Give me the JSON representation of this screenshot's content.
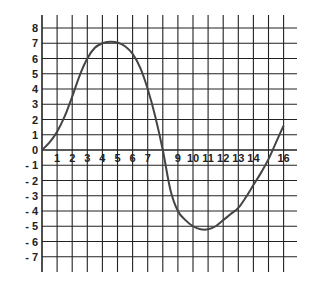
{
  "chart_data": {
    "type": "line",
    "title": "",
    "xlabel": "",
    "ylabel": "",
    "xlim": [
      0,
      16
    ],
    "ylim": [
      -7,
      8
    ],
    "grid": true,
    "x_ticks": [
      "1",
      "2",
      "3",
      "4",
      "5",
      "6",
      "7",
      "9",
      "10",
      "11",
      "12",
      "13",
      "14",
      "16"
    ],
    "y_ticks": [
      "8",
      "7",
      "6",
      "5",
      "4",
      "3",
      "2",
      "1",
      "0",
      "- 1",
      "- 2",
      "- 3",
      "- 4",
      "- 5",
      "- 6",
      "- 7"
    ],
    "series": [
      {
        "name": "curve",
        "x": [
          0,
          0.5,
          1,
          1.5,
          2,
          2.5,
          3,
          3.5,
          4,
          4.5,
          5,
          5.5,
          6,
          6.5,
          7,
          7.5,
          8,
          8.5,
          9,
          9.5,
          10,
          10.5,
          11,
          11.5,
          12,
          12.5,
          13,
          13.5,
          14,
          14.5,
          15,
          15.5,
          16
        ],
        "y": [
          0,
          0.5,
          1.2,
          2.2,
          3.5,
          4.9,
          6.0,
          6.7,
          7.0,
          7.1,
          7.05,
          6.8,
          6.3,
          5.4,
          4.0,
          2.2,
          0,
          -2.6,
          -4.0,
          -4.6,
          -5.0,
          -5.2,
          -5.2,
          -5.0,
          -4.6,
          -4.2,
          -3.8,
          -3.1,
          -2.3,
          -1.5,
          -0.6,
          0.5,
          1.6
        ]
      }
    ]
  },
  "colors": {
    "grid": "#222222",
    "curve": "#444444",
    "background": "#ffffff"
  }
}
